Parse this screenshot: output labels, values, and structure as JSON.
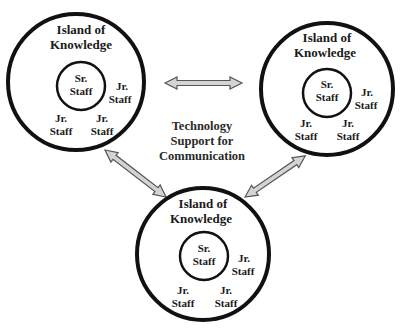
{
  "diagram": {
    "center_label": [
      "Technology",
      "Support for",
      "Communication"
    ],
    "islands": [
      {
        "id": "top-left",
        "title": [
          "Island of",
          "Knowledge"
        ],
        "senior": [
          "Sr.",
          "Staff"
        ],
        "juniors": [
          [
            "Jr.",
            "Staff"
          ],
          [
            "Jr.",
            "Staff"
          ],
          [
            "Jr.",
            "Staff"
          ]
        ]
      },
      {
        "id": "top-right",
        "title": [
          "Island of",
          "Knowledge"
        ],
        "senior": [
          "Sr.",
          "Staff"
        ],
        "juniors": [
          [
            "Jr.",
            "Staff"
          ],
          [
            "Jr.",
            "Staff"
          ],
          [
            "Jr.",
            "Staff"
          ]
        ]
      },
      {
        "id": "bottom",
        "title": [
          "Island of",
          "Knowledge"
        ],
        "senior": [
          "Sr.",
          "Staff"
        ],
        "juniors": [
          [
            "Jr.",
            "Staff"
          ],
          [
            "Jr.",
            "Staff"
          ],
          [
            "Jr.",
            "Staff"
          ]
        ]
      }
    ],
    "connections": [
      {
        "from": "top-left",
        "to": "top-right",
        "type": "double-arrow"
      },
      {
        "from": "top-left",
        "to": "bottom",
        "type": "double-arrow"
      },
      {
        "from": "top-right",
        "to": "bottom",
        "type": "double-arrow"
      }
    ],
    "colors": {
      "circle_stroke": "#111111",
      "arrow_fill": "#d4d4d4",
      "arrow_stroke": "#555555",
      "text": "#1a1a1a"
    }
  }
}
